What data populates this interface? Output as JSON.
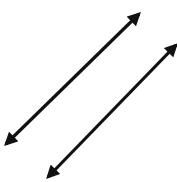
{
  "figure": {
    "caption_cut": "",
    "stroke_color": "#111111",
    "background": "#ffffff",
    "arrows": [
      {
        "name": "arrow-left",
        "x1": 6,
        "y1": 144,
        "x2": 139,
        "y2": 14,
        "heads": "both"
      },
      {
        "name": "arrow-right",
        "x1": 48,
        "y1": 177,
        "x2": 176,
        "y2": 45,
        "heads": "both"
      }
    ]
  }
}
